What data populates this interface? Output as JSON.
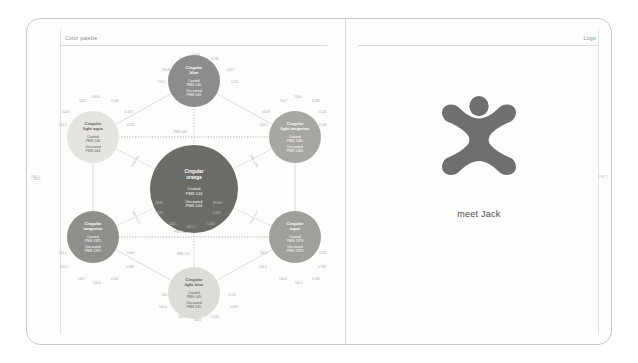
{
  "spread": {
    "left_page": {
      "header_label": "Color palette",
      "corner_tick": "◦",
      "edge_folio": "PM 1"
    },
    "right_page": {
      "header_label": "Logo",
      "corner_tick": "◦",
      "edge_folio": "PM 2",
      "caption": "meet Jack",
      "logo_name": "cingular-jack-logo",
      "logo_color": "#6f6f6f"
    }
  },
  "diagram": {
    "title": "Color palette",
    "type": "hexagon-node-diagram",
    "nodes": [
      {
        "id": "light-aqua",
        "name": "Cingular\nlight aqua",
        "name_line1": "Cingular",
        "name_line2": "light aqua",
        "coated": "Coated\nPMS 544",
        "coated_line1": "Coated",
        "coated_line2": "PMS 544",
        "uncoated": "Uncoated\nPMS 544",
        "uncoated_line1": "Uncoated",
        "uncoated_line2": "PMS 544",
        "fill": "#e4e4e0",
        "text": "#5d5d5d",
        "size": 52,
        "x": 6,
        "y": 56,
        "measures": {
          "top": "100.0",
          "top_left": "102.1",
          "top_right": "0.144",
          "left_upper": "102.6",
          "left_lower": "101.1",
          "right_upper": "0.131",
          "right_lower": "0.113"
        }
      },
      {
        "id": "blue",
        "name": "Cingular\nblue",
        "name_line1": "Cingular",
        "name_line2": "blue",
        "coated": "Coated\nPMS 540",
        "coated_line1": "Coated",
        "coated_line2": "PMS 540",
        "uncoated": "Uncoated\nPMS 540",
        "uncoated_line1": "Uncoated",
        "uncoated_line2": "PMS 540",
        "fill": "#8c8c8c",
        "text": "#ffffff",
        "size": 52,
        "x": 107,
        "y": 0,
        "measures": {
          "top": "100.0",
          "top_left": "101.1",
          "top_right": "0.130",
          "left_upper": "100.8",
          "left_lower": "100.1",
          "right_upper": "0.115",
          "right_lower": "0.111"
        }
      },
      {
        "id": "light-tangerine",
        "name": "Cingular\nlight tangerine",
        "name_line1": "Cingular",
        "name_line2": "light tangerine",
        "coated": "Coated\nPMS 1365",
        "coated_line1": "Coated",
        "coated_line2": "PMS 1365",
        "uncoated": "Uncoated\nPMS 1365",
        "uncoated_line1": "Uncoated",
        "uncoated_line2": "PMS 1365",
        "fill": "#a6a6a2",
        "text": "#ffffff",
        "size": 52,
        "x": 208,
        "y": 56,
        "measures": {
          "top": "100.0",
          "top_left": "100.7",
          "top_right": "0.240",
          "left_upper": "014.8",
          "left_lower": "100.1",
          "right_upper": "0.131",
          "right_lower": "0.140"
        }
      },
      {
        "id": "aqua",
        "name": "Cingular\naqua",
        "name_line1": "Cingular",
        "name_line2": "aqua",
        "coated": "Coated\nPMS 7473",
        "coated_line1": "Coated",
        "coated_line2": "PMS 7473",
        "uncoated": "Uncoated\nPMS 7473",
        "uncoated_line1": "Uncoated",
        "uncoated_line2": "PMS 7473",
        "fill": "#9f9f9b",
        "text": "#ffffff",
        "size": 52,
        "x": 208,
        "y": 156,
        "measures": {
          "bottom": "100.1",
          "bottom_left": "100.4",
          "bottom_right": "0.744",
          "left_upper": "100.2",
          "left_lower": "100.4",
          "right_upper": "0.113",
          "right_lower": "0.730"
        }
      },
      {
        "id": "light-blue",
        "name": "Cingular\nlight blue",
        "name_line1": "Cingular",
        "name_line2": "light blue",
        "coated": "Coated\nPMS 545",
        "coated_line1": "Coated",
        "coated_line2": "PMS 545",
        "uncoated": "Uncoated\nPMS 545",
        "uncoated_line1": "Uncoated",
        "uncoated_line2": "PMS 545",
        "fill": "#dcdcd8",
        "text": "#5d5d5d",
        "size": 52,
        "x": 107,
        "y": 212,
        "measures": {
          "bottom": "100.1",
          "bottom_left": "100.1",
          "bottom_right": "0.100",
          "left_upper": "101.1",
          "left_lower": "100.4",
          "right_upper": "0.710",
          "right_lower": "0.295"
        }
      },
      {
        "id": "tangerine",
        "name": "Cingular\ntangerine",
        "name_line1": "Cingular",
        "name_line2": "tangerine",
        "coated": "Coated\nPMS 1375",
        "coated_line1": "Coated",
        "coated_line2": "PMS 1375",
        "uncoated": "Uncoated\nPMS 1375",
        "uncoated_line1": "Uncoated",
        "uncoated_line2": "PMS 1375",
        "fill": "#8f8f8b",
        "text": "#ffffff",
        "size": 52,
        "x": 6,
        "y": 156,
        "measures": {
          "bottom": "100.4",
          "bottom_left": "100.7",
          "bottom_right": "0.110",
          "left_upper": "100.1",
          "left_lower": "100.4",
          "right_upper": "0.000",
          "right_lower": "0.148"
        }
      },
      {
        "id": "orange",
        "name": "Cingular\norange",
        "name_line1": "Cingular",
        "name_line2": "orange",
        "coated": "Coated\nPMS 144",
        "coated_line1": "Coated",
        "coated_line2": "PMS 144",
        "uncoated": "Uncoated\nPMS 144",
        "uncoated_line1": "Uncoated",
        "uncoated_line2": "PMS 144",
        "fill": "#6b6b68",
        "text": "#ffffff",
        "size": 88,
        "x": 89,
        "y": 90,
        "measures": {
          "inner_left_upper": "100%",
          "inner_left_lower": "55.19",
          "inner_right_upper": "W.000",
          "inner_right_lower": "0.007",
          "inner_bottom_left": "100.1",
          "inner_bottom_mid": "00.1.7",
          "inner_bottom_right": "1.005"
        }
      }
    ],
    "connector_labels": [
      {
        "id": "top-dotted",
        "text": "PMS 544"
      },
      {
        "id": "bottom-dotted",
        "text": "PMS 545"
      },
      {
        "id": "left-upper-diag",
        "text": "PMS 540"
      },
      {
        "id": "left-lower-diag",
        "text": "PMS 1375"
      },
      {
        "id": "right-upper-diag",
        "text": "PMS 1365"
      },
      {
        "id": "right-lower-diag",
        "text": "PMS 7473"
      },
      {
        "id": "center-bottom",
        "text": "PMS 144"
      }
    ],
    "edge_measures": {
      "far_left": "100.1"
    }
  }
}
